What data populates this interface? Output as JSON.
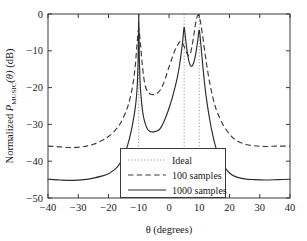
{
  "chart_data": {
    "type": "line",
    "title": "",
    "xlabel": "θ (degrees)",
    "ylabel": "Normalized P_MUSIC(θ) (dB)",
    "ylabel_parts": {
      "prefix": "Normalized ",
      "symbol": "P",
      "subscript": "MUSIC",
      "arg": "(θ)",
      "units": " (dB)"
    },
    "xlim": [
      -40,
      40
    ],
    "ylim": [
      -50,
      0
    ],
    "xticks": [
      -40,
      -30,
      -20,
      -10,
      0,
      10,
      20,
      30,
      40
    ],
    "xtick_labels": [
      "−40",
      "−30",
      "−20",
      "−10",
      "0",
      "10",
      "20",
      "30",
      "40"
    ],
    "yticks": [
      -50,
      -40,
      -30,
      -20,
      -10,
      0
    ],
    "ytick_labels": [
      "−50",
      "−40",
      "−30",
      "−20",
      "−10",
      "0"
    ],
    "grid": false,
    "legend_position": "lower center",
    "ideal_angles_deg": [
      -10,
      5,
      10
    ],
    "series": [
      {
        "name": "Ideal",
        "style": "dotted",
        "color": "#8d8d8d",
        "kind": "vertical-lines",
        "x": [
          -10,
          5,
          10
        ],
        "y_top": 0,
        "y_bottom": -50
      },
      {
        "name": "100 samples",
        "style": "dashed",
        "color": "#3a3a3a",
        "kind": "spectrum",
        "floor_db": -36,
        "peaks": [
          {
            "x": -10,
            "y": -4
          },
          {
            "x": 4,
            "y": -7.5
          },
          {
            "x": 9.5,
            "y": -0.3
          }
        ],
        "x": [
          -40,
          -36,
          -32,
          -28,
          -25,
          -22,
          -20,
          -18,
          -16,
          -14,
          -13,
          -12,
          -11.2,
          -10.6,
          -10,
          -9.4,
          -8.8,
          -8,
          -7,
          -6,
          -5,
          -4,
          -3,
          -2,
          -1,
          0,
          1,
          2,
          3,
          3.5,
          4,
          4.8,
          5.6,
          6.4,
          7,
          7.6,
          8.2,
          8.8,
          9.5,
          10.2,
          11,
          12,
          13,
          14,
          15,
          16,
          18,
          20,
          22,
          25,
          28,
          32,
          36,
          40
        ],
        "y": [
          -35.9,
          -36.1,
          -36.3,
          -36.0,
          -35.4,
          -34.3,
          -33.3,
          -31.8,
          -29.6,
          -26.0,
          -23.3,
          -19.5,
          -14.5,
          -8.5,
          -4.0,
          -8.5,
          -14.0,
          -19.0,
          -21.2,
          -21.8,
          -21.9,
          -21.6,
          -20.8,
          -19.3,
          -17.0,
          -14.4,
          -12.0,
          -9.8,
          -8.2,
          -7.6,
          -7.5,
          -8.4,
          -10.1,
          -11.3,
          -10.9,
          -8.8,
          -5.8,
          -2.6,
          -0.3,
          -1.4,
          -5.2,
          -11.2,
          -16.6,
          -20.9,
          -24.3,
          -26.8,
          -30.3,
          -32.6,
          -34.2,
          -35.3,
          -35.8,
          -36.0,
          -35.9,
          -35.9
        ]
      },
      {
        "name": "1000 samples",
        "style": "solid",
        "color": "#2b2b2b",
        "kind": "spectrum",
        "floor_db": -45,
        "peaks": [
          {
            "x": -10,
            "y": 0
          },
          {
            "x": 5,
            "y": -3.6
          },
          {
            "x": 10,
            "y": -4.4
          }
        ],
        "x": [
          -40,
          -36,
          -32,
          -28,
          -25,
          -22,
          -20,
          -18,
          -17,
          -16,
          -15,
          -14,
          -13,
          -12,
          -11,
          -10.5,
          -10.2,
          -10,
          -9.8,
          -9.5,
          -9,
          -8.5,
          -8,
          -7.5,
          -7,
          -6.5,
          -6,
          -5.5,
          -5,
          -4.5,
          -4,
          -3.5,
          -3,
          -2.5,
          -2,
          -1,
          0,
          1,
          2,
          2.8,
          3.5,
          4.1,
          4.6,
          5,
          5.4,
          5.9,
          6.5,
          7,
          7.5,
          8,
          8.5,
          9,
          9.5,
          10,
          10.5,
          11,
          11.5,
          12,
          12.6,
          13.2,
          14,
          15,
          16,
          17,
          18,
          20,
          22,
          25,
          28,
          32,
          36,
          40
        ],
        "y": [
          -44.9,
          -45.1,
          -45.2,
          -45.0,
          -44.6,
          -44.0,
          -43.4,
          -42.3,
          -41.5,
          -40.3,
          -38.7,
          -36.5,
          -33.6,
          -29.8,
          -24.5,
          -19.5,
          -12.0,
          0.0,
          -12.0,
          -19.5,
          -24.6,
          -27.6,
          -29.4,
          -30.6,
          -31.4,
          -31.8,
          -32.0,
          -32.1,
          -32.0,
          -31.9,
          -31.8,
          -31.6,
          -31.2,
          -30.6,
          -29.8,
          -27.9,
          -25.6,
          -23.0,
          -19.9,
          -17.0,
          -13.8,
          -10.3,
          -6.8,
          -3.6,
          -6.2,
          -9.5,
          -12.5,
          -13.9,
          -14.2,
          -13.6,
          -12.2,
          -10.0,
          -7.2,
          -4.4,
          -8.0,
          -12.5,
          -16.8,
          -20.6,
          -24.3,
          -27.4,
          -31.1,
          -34.8,
          -37.6,
          -39.7,
          -41.2,
          -43.2,
          -44.2,
          -44.8,
          -45.0,
          -45.1,
          -45.0,
          -44.9
        ]
      }
    ],
    "legend": [
      {
        "label": "Ideal",
        "style": "dotted"
      },
      {
        "label": "100 samples",
        "style": "dashed"
      },
      {
        "label": "1000 samples",
        "style": "solid"
      }
    ]
  }
}
